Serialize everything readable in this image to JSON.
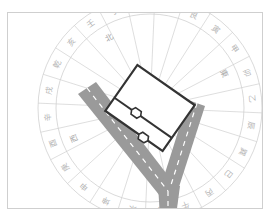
{
  "diagram": {
    "compass": {
      "center": [
        150,
        108
      ],
      "outer_radius": 112,
      "inner_radius": 94,
      "mountains": [
        "子",
        "癸",
        "丑",
        "艮",
        "寅",
        "甲",
        "卯",
        "乙",
        "辰",
        "巽",
        "巳",
        "丙",
        "午",
        "丁",
        "未",
        "坤",
        "申",
        "庚",
        "酉",
        "辛",
        "戌",
        "乾",
        "亥",
        "壬"
      ],
      "directions": {
        "north": "北",
        "east": "東",
        "south": "",
        "west": "西"
      }
    },
    "house": {
      "label": "house-footprint",
      "rotation_deg": 35
    },
    "road": {
      "shape": "Y-junction",
      "branches": [
        "upper-left",
        "upper-right",
        "bottom"
      ]
    },
    "colors": {
      "frame": "#cfcfcf",
      "ring_lines": "#d0d0d0",
      "ring_text": "#b5b5b5",
      "house_stroke": "#333333",
      "road": "#9a9a9a",
      "road_markings": "#ffffff"
    }
  }
}
